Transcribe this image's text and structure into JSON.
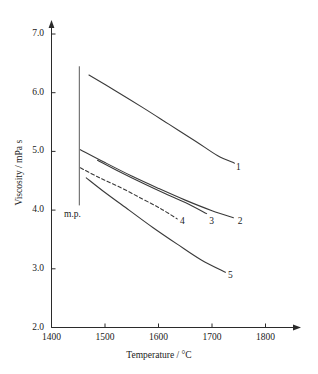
{
  "chart_data": {
    "type": "line",
    "title": "",
    "xlabel": "Temperature / °C",
    "ylabel": "Viscosity / mPa s",
    "xlim": [
      1380,
      1840
    ],
    "ylim": [
      2.0,
      7.4
    ],
    "xticks": [
      1400,
      1500,
      1600,
      1700,
      1800
    ],
    "xtick_labels": [
      "1400",
      "1500",
      "1600",
      "1700",
      "1800"
    ],
    "yticks": [
      2.0,
      3.0,
      4.0,
      5.0,
      6.0,
      7.0
    ],
    "ytick_labels": [
      "2.0",
      "3.0",
      "4.0",
      "5.0",
      "6.0",
      "7.0"
    ],
    "grid": false,
    "legend_position": "inline-end-of-curve",
    "annotations": [
      {
        "name": "melting-point-marker",
        "label": "m.p.",
        "x": 1452,
        "y_from": 4.08,
        "y_to": 6.45,
        "style": "vertical-line"
      }
    ],
    "series": [
      {
        "name": "1",
        "label": "1",
        "style": "solid",
        "label_x": 1745,
        "label_y": 4.72,
        "points": [
          [
            1470,
            6.3
          ],
          [
            1520,
            6.03
          ],
          [
            1570,
            5.75
          ],
          [
            1620,
            5.46
          ],
          [
            1670,
            5.17
          ],
          [
            1710,
            4.93
          ],
          [
            1742,
            4.8
          ]
        ]
      },
      {
        "name": "2",
        "label": "2",
        "style": "solid",
        "label_x": 1748,
        "label_y": 3.8,
        "points": [
          [
            1454,
            5.03
          ],
          [
            1500,
            4.81
          ],
          [
            1550,
            4.58
          ],
          [
            1600,
            4.37
          ],
          [
            1650,
            4.17
          ],
          [
            1700,
            3.99
          ],
          [
            1740,
            3.87
          ]
        ]
      },
      {
        "name": "3",
        "label": "3",
        "style": "solid",
        "label_x": 1695,
        "label_y": 3.8,
        "points": [
          [
            1486,
            4.85
          ],
          [
            1530,
            4.64
          ],
          [
            1570,
            4.46
          ],
          [
            1610,
            4.29
          ],
          [
            1650,
            4.13
          ],
          [
            1690,
            3.94
          ]
        ]
      },
      {
        "name": "4",
        "label": "4",
        "style": "dashed",
        "label_x": 1640,
        "label_y": 3.8,
        "points": [
          [
            1454,
            4.72
          ],
          [
            1490,
            4.55
          ],
          [
            1530,
            4.38
          ],
          [
            1570,
            4.19
          ],
          [
            1605,
            4.02
          ],
          [
            1635,
            3.85
          ]
        ]
      },
      {
        "name": "5",
        "label": "5",
        "style": "solid",
        "label_x": 1730,
        "label_y": 2.88,
        "points": [
          [
            1465,
            4.55
          ],
          [
            1500,
            4.3
          ],
          [
            1545,
            4.0
          ],
          [
            1590,
            3.7
          ],
          [
            1635,
            3.42
          ],
          [
            1680,
            3.15
          ],
          [
            1725,
            2.94
          ]
        ]
      }
    ]
  }
}
